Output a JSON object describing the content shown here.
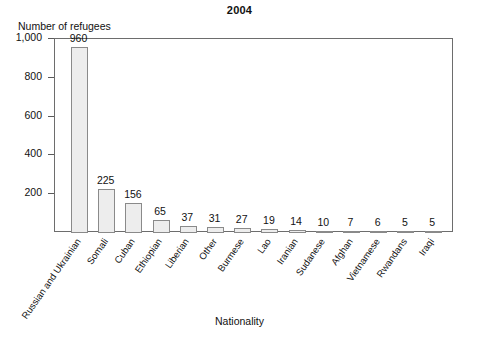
{
  "chart_data": {
    "type": "bar",
    "title": "2004",
    "xlabel": "Nationality",
    "ylabel": "Number of refugees",
    "categories": [
      "Russian and Ukrainian",
      "Somali",
      "Cuban",
      "Ethiopian",
      "Liberian",
      "Other",
      "Burmese",
      "Lao",
      "Iranian",
      "Sudanese",
      "Afghan",
      "Vietnamese",
      "Rwandans",
      "Iraqi"
    ],
    "values": [
      960,
      225,
      156,
      65,
      37,
      31,
      27,
      19,
      14,
      10,
      7,
      6,
      5,
      5
    ],
    "value_labels": [
      "960",
      "225",
      "156",
      "65",
      "37",
      "31",
      "27",
      "19",
      "14",
      "10",
      "7",
      "6",
      "5",
      "5"
    ],
    "ylim": [
      0,
      1000
    ],
    "yticks": [
      200,
      400,
      600,
      800,
      1000
    ],
    "ytick_labels": [
      "200",
      "400",
      "600",
      "800",
      "1,000"
    ],
    "grid": false,
    "legend": "none",
    "bar_fill_color": "#ededed",
    "bar_edge_color": "#8a8a8a",
    "frame_color": "#6d6d6d",
    "text_color": "#111111"
  }
}
